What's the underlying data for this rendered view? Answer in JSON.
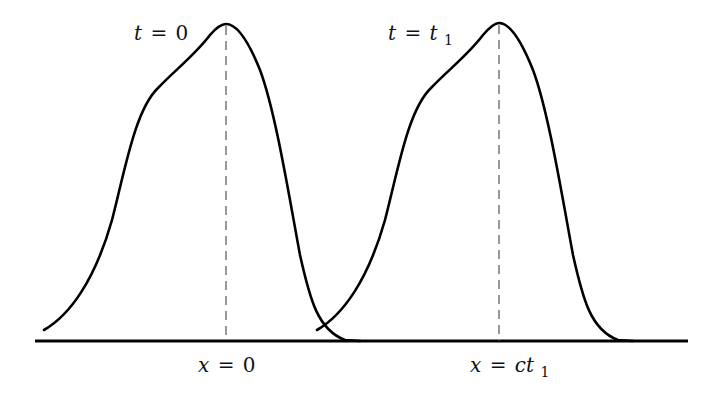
{
  "diagram": {
    "axis": {
      "x_start": 35,
      "x_end": 688,
      "y": 341
    },
    "pulses": [
      {
        "name": "pulse-t0",
        "time_label": {
          "var": "t",
          "eq": "=",
          "value": "0",
          "subscript": ""
        },
        "position_label": {
          "var": "x",
          "eq": "=",
          "value": "0",
          "subscript": ""
        },
        "peak_x": 225,
        "peak_y": 24
      },
      {
        "name": "pulse-t1",
        "time_label": {
          "var": "t",
          "eq": "=",
          "value": "t",
          "subscript": "1"
        },
        "position_label": {
          "var": "x",
          "eq": "=",
          "value": "ct",
          "subscript": "1"
        },
        "peak_x": 498,
        "peak_y": 23
      }
    ],
    "colors": {
      "curve": "#000000",
      "axis": "#000000",
      "dashed": "#555555",
      "background": "#ffffff"
    }
  }
}
